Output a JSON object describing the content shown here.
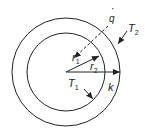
{
  "diagram": {
    "labels": {
      "q_dot": "q",
      "T2": "T",
      "T2_sub": "2",
      "r1": "r",
      "r1_sub": "1",
      "r2": "r",
      "r2_sub": "2",
      "T1": "T",
      "T1_sub": "1",
      "k": "k"
    },
    "geometry": {
      "center": [
        66,
        72
      ],
      "inner_radius": 39,
      "outer_radius": 54
    },
    "colors": {
      "stroke": "#222222",
      "background": "#ffffff"
    }
  }
}
